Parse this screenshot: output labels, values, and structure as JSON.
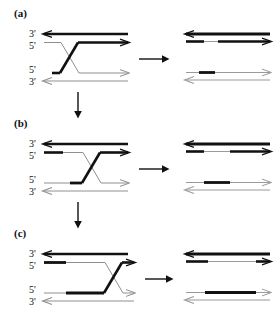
{
  "figure": {
    "type": "diagram",
    "background": "#ffffff",
    "stroke_color": "#111111",
    "highlight_color": "#000000",
    "thin_color": "#9a9a9a",
    "width": 276,
    "height": 332
  },
  "panels": [
    {
      "id": "a",
      "label": "(a)",
      "stage": 1,
      "description": "Holliday junction with crossover near the left; exchanged (black) segments are short.",
      "end_labels": {
        "top_left_upper": "3'",
        "top_left_lower": "5'",
        "bottom_left_upper": "5'",
        "bottom_left_lower": "3'"
      },
      "crossover_x": 60,
      "reaction_arrow": "right-arrow",
      "junction": {
        "top_black_start_pct": 18,
        "top_black_end_pct": 100,
        "bottom_black_start_pct": 10,
        "bottom_black_end_pct": 14
      },
      "products": {
        "top": {
          "black_start_pct": 0,
          "black_end_pct": 22,
          "black2_start_pct": 38,
          "black2_end_pct": 100
        },
        "bottom": {
          "black_start_pct": 16,
          "black_end_pct": 34
        }
      }
    },
    {
      "id": "b",
      "label": "(b)",
      "stage": 2,
      "description": "Crossover has migrated rightward; exchanged (black) segments are longer.",
      "end_labels": {
        "top_left_upper": "3'",
        "top_left_lower": "5'",
        "bottom_left_upper": "5'",
        "bottom_left_lower": "3'"
      },
      "crossover_x": 82,
      "reaction_arrow": "right-arrow",
      "junction": {
        "top_black_start_pct": 30,
        "top_black_end_pct": 100,
        "bottom_black_start_pct": 30,
        "bottom_black_end_pct": 44
      },
      "products": {
        "top": {
          "black_start_pct": 0,
          "black_end_pct": 22,
          "black2_start_pct": 52,
          "black2_end_pct": 100
        },
        "bottom": {
          "black_start_pct": 22,
          "black_end_pct": 52
        }
      }
    },
    {
      "id": "c",
      "label": "(c)",
      "stage": 3,
      "description": "Crossover has migrated farther right; exchanged (black) segments are longest.",
      "end_labels": {
        "top_left_upper": "3'",
        "top_left_lower": "5'",
        "bottom_left_upper": "5'",
        "bottom_left_lower": "3'"
      },
      "crossover_x": 104,
      "reaction_arrow": "right-arrow",
      "junction": {
        "top_black_start_pct": 0,
        "top_black_end_pct": 26,
        "bottom_black_start_pct": 24,
        "bottom_black_end_pct": 66
      },
      "products": {
        "top": {
          "black_start_pct": 0,
          "black_end_pct": 26,
          "black2_start_pct": 84,
          "black2_end_pct": 100
        },
        "bottom": {
          "black_start_pct": 22,
          "black_end_pct": 84
        }
      }
    }
  ],
  "transitions": [
    {
      "name": "step-a-to-b",
      "icon": "down-arrow-icon"
    },
    {
      "name": "step-b-to-c",
      "icon": "down-arrow-icon"
    }
  ],
  "arrows": {
    "reaction": "right-arrow-icon",
    "migration": "down-arrow-icon"
  }
}
